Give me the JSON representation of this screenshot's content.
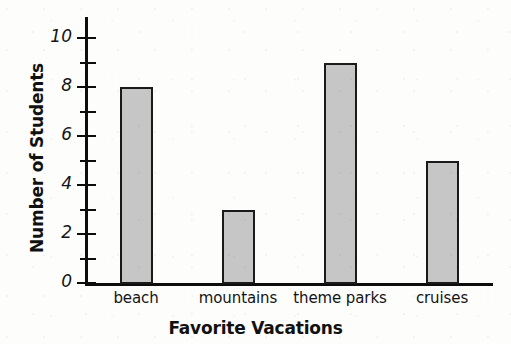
{
  "chart_data": {
    "type": "bar",
    "title": "",
    "xlabel": "Favorite Vacations",
    "ylabel": "Number of Students",
    "categories": [
      "beach",
      "mountains",
      "theme parks",
      "cruises"
    ],
    "values": [
      8,
      3,
      9,
      5
    ],
    "ylim": [
      0,
      11
    ],
    "y_major_ticks": [
      0,
      2,
      4,
      6,
      8,
      10
    ],
    "y_minor_ticks": [
      1,
      3,
      5,
      7,
      9
    ],
    "y_tick_labels": [
      "0",
      "2",
      "4",
      "6",
      "8",
      "10"
    ],
    "grid": false,
    "legend": false,
    "bar_fill_color": "#c6c6c6",
    "bar_border_color": "#1a1a1a",
    "axis_color": "#0d0d0d",
    "background_color": "#fdfdfc"
  },
  "axes": {
    "y_title": "Number of Students",
    "x_title": "Favorite Vacations"
  },
  "y_ticks": [
    {
      "value": 10,
      "label": "10",
      "major": true
    },
    {
      "value": 9,
      "label": "",
      "major": false
    },
    {
      "value": 8,
      "label": "8",
      "major": true
    },
    {
      "value": 7,
      "label": "",
      "major": false
    },
    {
      "value": 6,
      "label": "6",
      "major": true
    },
    {
      "value": 5,
      "label": "",
      "major": false
    },
    {
      "value": 4,
      "label": "4",
      "major": true
    },
    {
      "value": 3,
      "label": "",
      "major": false
    },
    {
      "value": 2,
      "label": "2",
      "major": true
    },
    {
      "value": 1,
      "label": "",
      "major": false
    },
    {
      "value": 0,
      "label": "0",
      "major": true
    }
  ],
  "bars": [
    {
      "category": "beach",
      "value": 8
    },
    {
      "category": "mountains",
      "value": 3
    },
    {
      "category": "theme parks",
      "value": 9
    },
    {
      "category": "cruises",
      "value": 5
    }
  ]
}
